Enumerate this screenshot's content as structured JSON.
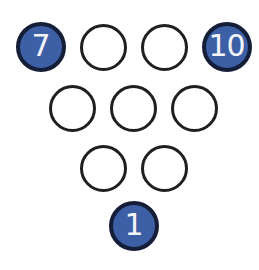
{
  "figure_name": "inverted-triangle-circle-puzzle",
  "colors": {
    "background": "#ffffff",
    "filled_circle_fill": "#3d5fa6",
    "filled_circle_ring": "#151e38",
    "empty_circle_stroke": "#1f1f1f",
    "number_text": "#f2f4f8"
  },
  "rows": [
    {
      "circles": [
        {
          "filled": true,
          "label": "7"
        },
        {
          "filled": false,
          "label": ""
        },
        {
          "filled": false,
          "label": ""
        },
        {
          "filled": true,
          "label": "10"
        }
      ]
    },
    {
      "circles": [
        {
          "filled": false,
          "label": ""
        },
        {
          "filled": false,
          "label": ""
        },
        {
          "filled": false,
          "label": ""
        }
      ]
    },
    {
      "circles": [
        {
          "filled": false,
          "label": ""
        },
        {
          "filled": false,
          "label": ""
        }
      ]
    },
    {
      "circles": [
        {
          "filled": true,
          "label": "1"
        }
      ]
    }
  ]
}
